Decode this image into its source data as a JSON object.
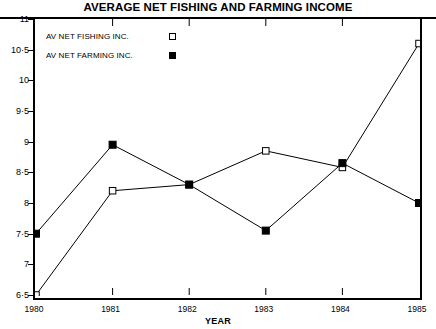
{
  "chart_data": {
    "type": "line",
    "title": "AVERAGE NET FISHING AND FARMING INCOME",
    "xlabel": "YEAR",
    "ylabel": "",
    "x": [
      1980,
      1981,
      1982,
      1983,
      1984,
      1985
    ],
    "categories": [
      "1980",
      "1981",
      "1982",
      "1983",
      "1984",
      "1985"
    ],
    "xlim": [
      1980,
      1985
    ],
    "ylim": [
      6.5,
      11
    ],
    "ytick_labels": [
      "6·5",
      "7",
      "7·5",
      "8",
      "8·5",
      "9",
      "9·5",
      "10",
      "10·5",
      "11"
    ],
    "ytick_values": [
      6.5,
      7,
      7.5,
      8,
      8.5,
      9,
      9.5,
      10,
      10.5,
      11
    ],
    "grid": false,
    "legend_position": "top-left",
    "series": [
      {
        "name": "AV NET FISHING INC.",
        "marker": "open-square",
        "values": [
          6.5,
          8.2,
          8.3,
          8.85,
          8.58,
          10.6
        ]
      },
      {
        "name": "AV NET FARMING INC.",
        "marker": "filled-square",
        "values": [
          7.5,
          8.95,
          8.3,
          7.55,
          8.65,
          8.0
        ]
      }
    ]
  },
  "colors": {
    "line": "#000000",
    "background": "#ffffff",
    "axis": "#000000"
  }
}
